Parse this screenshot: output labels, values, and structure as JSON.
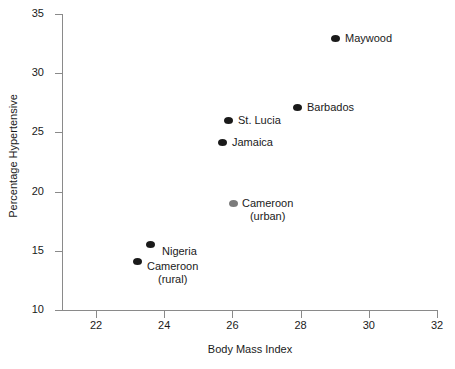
{
  "chart_data": {
    "type": "scatter",
    "title": "",
    "xlabel": "Body Mass Index",
    "ylabel": "Percentage Hypertensive",
    "xlim": [
      21,
      32
    ],
    "ylim": [
      10,
      35
    ],
    "xticks": [
      22,
      24,
      26,
      28,
      30,
      32
    ],
    "yticks": [
      10,
      15,
      20,
      25,
      30,
      35
    ],
    "grid": false,
    "legend": "none",
    "points": [
      {
        "label": "Maywood",
        "label_lines": [
          "Maywood"
        ],
        "x": 29.0,
        "y": 33.3,
        "color": "#1a1a1a",
        "px": 335,
        "py": 38,
        "label_x": 345,
        "label_y": 32
      },
      {
        "label": "Barbados",
        "label_lines": [
          "Barbados"
        ],
        "x": 27.9,
        "y": 27.2,
        "color": "#1a1a1a",
        "px": 297,
        "py": 107,
        "label_x": 307,
        "label_y": 101
      },
      {
        "label": "St. Lucia",
        "label_lines": [
          "St. Lucia"
        ],
        "x": 25.9,
        "y": 26.1,
        "color": "#1a1a1a",
        "px": 228,
        "py": 120,
        "label_x": 238,
        "label_y": 114
      },
      {
        "label": "Jamaica",
        "label_lines": [
          "Jamaica"
        ],
        "x": 25.7,
        "y": 24.2,
        "color": "#1a1a1a",
        "px": 222,
        "py": 142,
        "label_x": 232,
        "label_y": 136
      },
      {
        "label": "Cameroon (urban)",
        "label_lines": [
          "Cameroon",
          "(urban)"
        ],
        "x": 26.0,
        "y": 19.2,
        "color": "#7b7b7b",
        "px": 233,
        "py": 203,
        "label_x": 242,
        "label_y": 197
      },
      {
        "label": "Nigeria",
        "label_lines": [
          "Nigeria"
        ],
        "x": 23.6,
        "y": 15.5,
        "color": "#1a1a1a",
        "px": 150,
        "py": 244,
        "label_x": 162,
        "label_y": 245
      },
      {
        "label": "Cameroon (rural)",
        "label_lines": [
          "Cameroon",
          "(rural)"
        ],
        "x": 23.2,
        "y": 14.1,
        "color": "#1a1a1a",
        "px": 137,
        "py": 261,
        "label_x": 147,
        "label_y": 260
      }
    ]
  },
  "axes": {
    "x_tick_labels": [
      "22",
      "24",
      "26",
      "28",
      "30",
      "32"
    ],
    "y_tick_labels": [
      "10",
      "15",
      "20",
      "25",
      "30",
      "35"
    ],
    "x_title": "Body Mass Index",
    "y_title": "Percentage Hypertensive"
  }
}
